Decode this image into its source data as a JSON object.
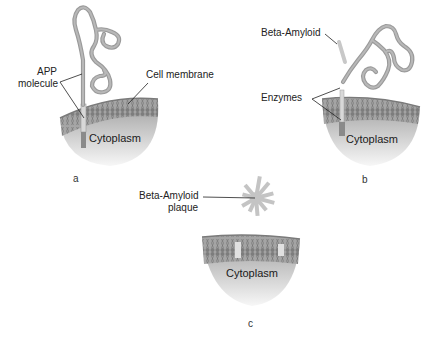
{
  "diagram": {
    "colors": {
      "protein": "#9a9a9a",
      "membrane": "#7f7f7f",
      "cytoplasm_top": "#a6a6a6",
      "cytoplasm_bottom": "#f4f4f4",
      "beta_amyloid": "#c8c8c8",
      "leader_line": "#222222"
    },
    "panels": [
      {
        "id": "a",
        "label": "a",
        "cytoplasm_label": "Cytoplasm",
        "annotations": [
          {
            "name": "app-molecule",
            "line1": "APP",
            "line2": "molecule"
          },
          {
            "name": "cell-membrane",
            "text": "Cell membrane"
          }
        ]
      },
      {
        "id": "b",
        "label": "b",
        "cytoplasm_label": "Cytoplasm",
        "annotations": [
          {
            "name": "beta-amyloid",
            "text": "Beta-Amyloid"
          },
          {
            "name": "enzymes",
            "text": "Enzymes"
          }
        ]
      },
      {
        "id": "c",
        "label": "c",
        "cytoplasm_label": "Cytoplasm",
        "annotations": [
          {
            "name": "beta-amyloid-plaque",
            "line1": "Beta-Amyloid",
            "line2": "plaque"
          }
        ]
      }
    ]
  }
}
